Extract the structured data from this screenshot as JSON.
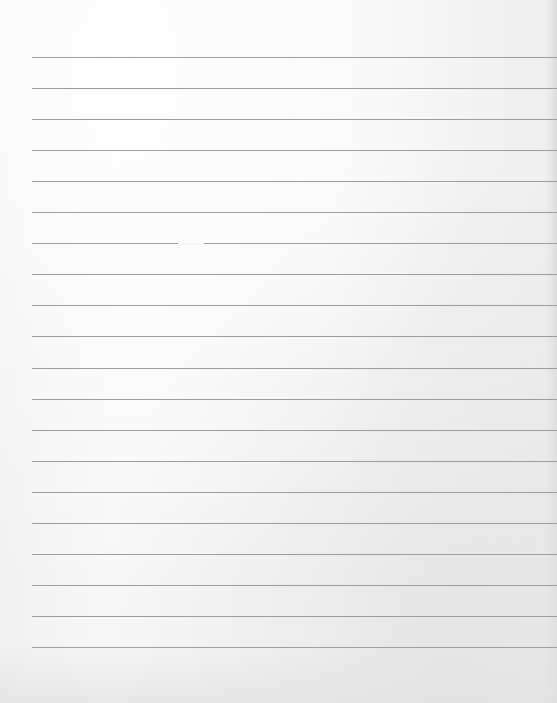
{
  "document": {
    "type": "lined-paper",
    "line_count": 20,
    "line_color": "#9c9c9c",
    "paper_color": "#f6f6f6",
    "text": []
  }
}
